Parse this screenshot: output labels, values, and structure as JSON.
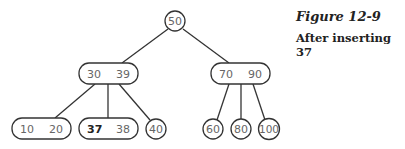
{
  "caption": {
    "title": "Figure 12-9",
    "subtitle": "After inserting 37"
  },
  "tree": {
    "root": {
      "keys": [
        "50"
      ]
    },
    "level1": [
      {
        "keys": [
          "30",
          "39"
        ]
      },
      {
        "keys": [
          "70",
          "90"
        ]
      }
    ],
    "leaves": [
      {
        "keys": [
          "10",
          "20"
        ]
      },
      {
        "keys": [
          "37",
          "38"
        ],
        "highlight": "37"
      },
      {
        "keys": [
          "40"
        ]
      },
      {
        "keys": [
          "60"
        ]
      },
      {
        "keys": [
          "80"
        ]
      },
      {
        "keys": [
          "100"
        ]
      }
    ]
  },
  "colors": {
    "stroke": "#333333",
    "text": "#666666",
    "highlight_text": "#222222"
  }
}
